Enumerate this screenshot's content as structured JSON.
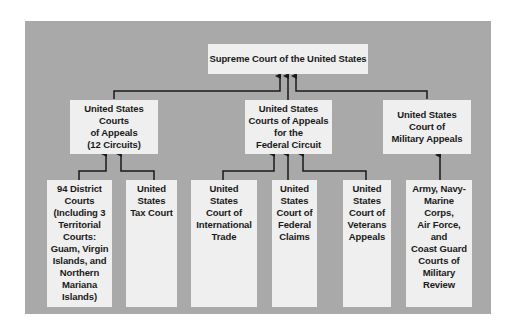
{
  "chart": {
    "title": "Supreme Court of the United States",
    "middle": [
      {
        "id": "appeals",
        "label": "United States\nCourts\nof Appeals\n(12 Circuits)"
      },
      {
        "id": "federal",
        "label": "United States\nCourts of Appeals\nfor the\nFederal Circuit"
      },
      {
        "id": "military",
        "label": "United States\nCourt of\nMilitary Appeals"
      }
    ],
    "bottom": [
      {
        "id": "district",
        "label": "94 District\nCourts\n(Including 3\nTerritorial\nCourts:\nGuam, Virgin\nIslands, and\nNorthern\nMariana\nIslands)"
      },
      {
        "id": "tax",
        "label": "United\nStates\nTax Court"
      },
      {
        "id": "intl",
        "label": "United\nStates\nCourt of\nInternational\nTrade"
      },
      {
        "id": "claims",
        "label": "United\nStates\nCourt of\nFederal\nClaims"
      },
      {
        "id": "veterans",
        "label": "United\nStates\nCourt of\nVeterans\nAppeals"
      },
      {
        "id": "review",
        "label": "Army, Navy-\nMarine\nCorps,\nAir Force,\nand\nCoast Guard\nCourts of\nMilitary\nReview"
      }
    ],
    "colors": {
      "panel": "#a9a9a9",
      "box": "#efefef",
      "line": "#1a1a1a"
    }
  }
}
